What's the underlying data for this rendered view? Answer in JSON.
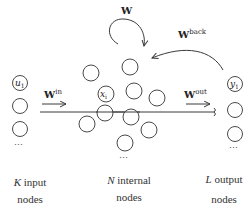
{
  "diagram": {
    "type": "echo-state-network",
    "input_layer": {
      "first_label": "u",
      "first_subscript": "1",
      "ellipsis": "⋯",
      "caption_var": "K",
      "caption_line1": " input",
      "caption_line2": "nodes"
    },
    "reservoir": {
      "highlight_label": "x",
      "highlight_subscript": "i",
      "ellipsis": "⋯",
      "caption_var": "N",
      "caption_line1": " internal",
      "caption_line2": "nodes"
    },
    "output_layer": {
      "first_label": "y",
      "first_subscript": "1",
      "ellipsis": "⋯",
      "caption_var": "L",
      "caption_line1": " output",
      "caption_line2": "nodes"
    },
    "weights": {
      "input": {
        "base": "W",
        "sup": "in"
      },
      "recurrent": {
        "base": "W",
        "sup": ""
      },
      "output": {
        "base": "W",
        "sup": "out"
      },
      "feedback": {
        "base": "W",
        "sup": "back"
      }
    }
  }
}
